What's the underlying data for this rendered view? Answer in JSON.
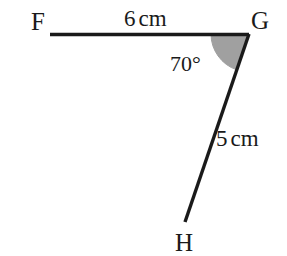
{
  "figure": {
    "type": "geometry-diagram",
    "background_color": "#ffffff",
    "stroke_color": "#1a1a1a",
    "shade_color": "#a0a0a0",
    "vertices": [
      {
        "name": "F",
        "label": "F",
        "x": 50,
        "y": 34
      },
      {
        "name": "G",
        "label": "G",
        "x": 249,
        "y": 34
      },
      {
        "name": "H",
        "label": "H",
        "x": 185,
        "y": 222
      }
    ],
    "segments": [
      {
        "name": "segment-FG",
        "from": "F",
        "to": "G",
        "length_label": "6 cm",
        "length_value": 6,
        "unit": "cm"
      },
      {
        "name": "segment-GH",
        "from": "G",
        "to": "H",
        "length_label": "5 cm",
        "length_value": 5,
        "unit": "cm"
      }
    ],
    "angles": [
      {
        "name": "angle-G",
        "at": "G",
        "label": "70°",
        "value": 70,
        "unit": "degrees",
        "shaded": true,
        "radius": 38
      }
    ],
    "labels": {
      "vertex_F": "F",
      "vertex_G": "G",
      "vertex_H": "H",
      "side_FG_number": "6",
      "side_FG_unit": "cm",
      "side_GH_number": "5",
      "side_GH_unit": "cm",
      "angle_G": "70°"
    }
  }
}
